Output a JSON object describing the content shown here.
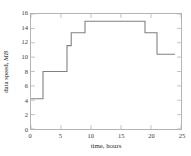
{
  "chart_data": {
    "type": "line",
    "title": "",
    "xlabel": "time, hours",
    "ylabel": "data speed, ",
    "ylabel_unit": "MB",
    "xlim": [
      0,
      25
    ],
    "ylim": [
      0,
      16
    ],
    "xticks": [
      0,
      5,
      10,
      15,
      20,
      25
    ],
    "yticks": [
      0,
      2,
      4,
      6,
      8,
      10,
      12,
      14,
      16
    ],
    "grid": false,
    "legend": null,
    "line_color": "#808080",
    "step_style": "post",
    "series": [
      {
        "name": "data speed",
        "x": [
          0,
          2,
          2,
          6,
          6,
          6.7,
          6.7,
          9,
          9,
          19,
          19,
          21,
          21,
          24
        ],
        "y": [
          4.2,
          4.2,
          8.0,
          8.0,
          11.6,
          11.6,
          13.4,
          13.4,
          15.0,
          15.0,
          13.4,
          13.4,
          10.4,
          10.4
        ],
        "steps": [
          {
            "x_start": 0,
            "x_end": 2,
            "value": 4.2
          },
          {
            "x_start": 2,
            "x_end": 6,
            "value": 8.0
          },
          {
            "x_start": 6,
            "x_end": 6.7,
            "value": 11.6
          },
          {
            "x_start": 6.7,
            "x_end": 9,
            "value": 13.4
          },
          {
            "x_start": 9,
            "x_end": 19,
            "value": 15.0
          },
          {
            "x_start": 19,
            "x_end": 21,
            "value": 13.4
          },
          {
            "x_start": 21,
            "x_end": 24,
            "value": 10.4
          }
        ]
      }
    ]
  },
  "axes": {
    "frame_color": "#b4b4b4",
    "tick_color": "#b4b4b4",
    "label_color": "#2b2b2b"
  }
}
